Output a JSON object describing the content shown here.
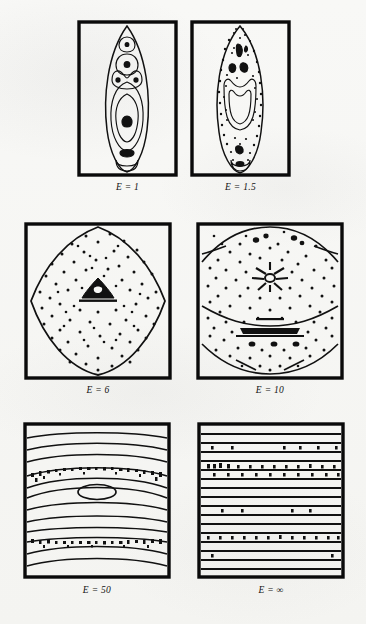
{
  "figure": {
    "caption_present": false,
    "background_color": "#f6f6f4",
    "ink_color": "#111111",
    "rows": 3,
    "columns": 2
  },
  "panels": [
    {
      "id": "panel-e-1",
      "label": "E = 1",
      "parameter_symbol": "E",
      "parameter_value": "1",
      "row": 1,
      "column": 1,
      "frame": {
        "x": 77,
        "y": 20,
        "width": 101,
        "height": 157
      },
      "label_position": {
        "x": 127,
        "y": 190
      },
      "description": "tall vertical lens with nested closed contours, no stipple",
      "stipple": false,
      "shape": "vertical-lens"
    },
    {
      "id": "panel-e-1-5",
      "label": "E = 1.5",
      "parameter_symbol": "E",
      "parameter_value": "1.5",
      "row": 1,
      "column": 2,
      "frame": {
        "x": 190,
        "y": 20,
        "width": 101,
        "height": 157
      },
      "label_position": {
        "x": 240,
        "y": 190
      },
      "description": "vertical lens densely stippled with a cup-shaped inner contour",
      "stipple": true,
      "shape": "vertical-lens"
    },
    {
      "id": "panel-e-6",
      "label": "E = 6",
      "parameter_symbol": "E",
      "parameter_value": "6",
      "row": 2,
      "column": 1,
      "frame": {
        "x": 24,
        "y": 222,
        "width": 148,
        "height": 158
      },
      "label_position": {
        "x": 98,
        "y": 393
      },
      "description": "rounded diamond contour, heavy stipple fill, small triangular motif at centre",
      "stipple": true,
      "shape": "rounded-diamond"
    },
    {
      "id": "panel-e-10",
      "label": "E = 10",
      "parameter_symbol": "E",
      "parameter_value": "10",
      "row": 2,
      "column": 2,
      "frame": {
        "x": 196,
        "y": 222,
        "width": 148,
        "height": 158
      },
      "label_position": {
        "x": 270,
        "y": 393
      },
      "description": "flattened hexagonal contours with horizontal banding, heavy stipple, starburst motif at centre",
      "stipple": true,
      "shape": "flattened-hexagon"
    },
    {
      "id": "panel-e-50",
      "label": "E = 50",
      "parameter_symbol": "E",
      "parameter_value": "50",
      "row": 3,
      "column": 1,
      "frame": {
        "x": 23,
        "y": 422,
        "width": 148,
        "height": 157
      },
      "label_position": {
        "x": 97,
        "y": 592
      },
      "description": "horizontal wavy bands, two stippled bands, small ellipse at centre",
      "stipple": true,
      "shape": "horizontal-bands-wavy"
    },
    {
      "id": "panel-e-infinity",
      "label": "E = ∞",
      "parameter_symbol": "E",
      "parameter_value": "∞",
      "row": 3,
      "column": 2,
      "frame": {
        "x": 197,
        "y": 422,
        "width": 148,
        "height": 157
      },
      "label_position": {
        "x": 271,
        "y": 592
      },
      "description": "perfectly straight horizontal lines with sparse dots along a few lines",
      "stipple": true,
      "shape": "horizontal-bands-straight"
    }
  ]
}
